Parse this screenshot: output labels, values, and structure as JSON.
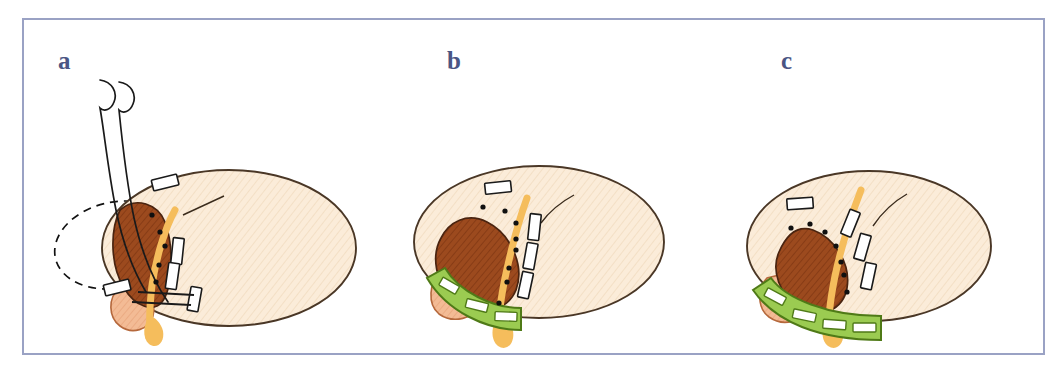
{
  "figure": {
    "type": "surgical-anatomy-illustration",
    "border_color": "#9aa2c4",
    "background_color": "#ffffff",
    "panel_count": 3
  },
  "palette": {
    "organ_fill": "#fbecd9",
    "organ_stroke": "#4a3726",
    "mass_fill": "#9c4a1e",
    "mass_stroke": "#4a2410",
    "vessel_fill": "#f5bd5c",
    "vessel_stroke": "#f0a93c",
    "lobe_fill": "#f3bb95",
    "lobe_stroke": "#b5683c",
    "stapler_fill": "#9bcb51",
    "stapler_stroke": "#4f7a17",
    "clip_fill": "#ffffff",
    "clip_stroke": "#1a1a1a",
    "dot_color": "#101010",
    "instrument_stroke": "#1a1a1a",
    "dashed_stroke": "#111111",
    "label_color": "#4a5584"
  },
  "panels": [
    {
      "id": "a",
      "label": "a",
      "description": "Resection field with two curved retractor instruments and dashed resection outline; no stapler band applied",
      "has_stapler": false,
      "has_retractors": true,
      "has_dashed_outline": true,
      "clip_count": 5,
      "dot_count": 5,
      "stapler_window_count": 0
    },
    {
      "id": "b",
      "label": "b",
      "description": "Short green stapler band applied across the inferior margin with three windows",
      "has_stapler": true,
      "has_retractors": false,
      "has_dashed_outline": false,
      "clip_count": 4,
      "dot_count": 8,
      "stapler_window_count": 3
    },
    {
      "id": "c",
      "label": "c",
      "description": "Extended green stapler band applied further across the inferior margin with four windows",
      "has_stapler": true,
      "has_retractors": false,
      "has_dashed_outline": false,
      "clip_count": 4,
      "dot_count": 7,
      "stapler_window_count": 4
    }
  ],
  "caption": {
    "left_fragment": "",
    "right_fragment": ""
  }
}
